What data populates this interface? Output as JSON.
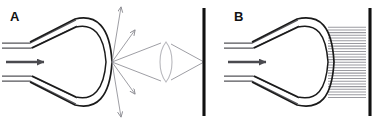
{
  "figure": {
    "width": 380,
    "height": 124,
    "background": "#ffffff",
    "type": "scientific-diagram"
  },
  "colors": {
    "outline": "#1a1a1a",
    "ray": "#8d8d93",
    "lens": "#b8b8bd",
    "hatch": "#9a9aa0",
    "bar": "#111111",
    "arrow": "#4a4a4f",
    "guide": "#55555a",
    "label": "#111111"
  },
  "panels": [
    {
      "id": "A",
      "label": "A",
      "label_x": 10,
      "label_y": 21,
      "components": {
        "waveguide_label": "input waveguide",
        "horn_label": "horn antenna",
        "propagation_arrow_label": "incident wave direction",
        "scattered_rays_label": "diverging radiated rays",
        "lens_label": "biconvex focusing lens",
        "screen_label": "screen",
        "focus_label": "focal point"
      },
      "ray_count": 8,
      "screen_x": 204,
      "lens_center_x": 166,
      "lens_center_y": 62
    },
    {
      "id": "B",
      "label": "B",
      "label_x": 234,
      "label_y": 21,
      "components": {
        "waveguide_label": "input waveguide",
        "horn_label": "horn antenna",
        "propagation_arrow_label": "incident wave direction",
        "dielectric_label": "hatched dielectric coupling block",
        "screen_label": "screen"
      },
      "hatch_line_count": 27,
      "screen_x": 370,
      "block_left_x": 328,
      "block_right_x": 366
    }
  ],
  "geometry": {
    "panelA": {
      "horn_outer": "M 30,42 L 75,19 C 96,14 110,26 112,62 C 110,98 96,110 75,105 L 30,82",
      "horn_inner": "M 32,48 L 76,27 C 93,23 104,34 106,62 C 104,90 93,101 76,97 L 32,76",
      "waveguide_top_a": "M 2,43 L 30,43 L 76,20",
      "waveguide_top_b": "M 2,48 L 31,48 L 77,26",
      "waveguide_bot_a": "M 2,76 L 31,76 L 77,98",
      "waveguide_bot_b": "M 2,81 L 30,81 L 76,104",
      "arrow_y": 62,
      "arrow_x1": 6,
      "arrow_x2": 46,
      "aperture_focus_x": 112,
      "aperture_focus_y": 62,
      "scatter_targets": [
        [
          122,
          6
        ],
        [
          136,
          30
        ],
        [
          149,
          48
        ],
        [
          200,
          44
        ],
        [
          200,
          80
        ],
        [
          149,
          76
        ],
        [
          136,
          95
        ],
        [
          122,
          118
        ]
      ],
      "lens_top_y": 42,
      "lens_bot_y": 82,
      "screen_top_y": 8,
      "screen_bot_y": 116
    },
    "panelB": {
      "horn_outer": "M 252,42 L 297,19 C 320,14 332,26 334,62 C 332,98 320,110 297,105 L 252,82",
      "horn_inner": "M 254,48 L 298,27 C 317,23 326,34 328,62 C 326,90 317,101 298,97 L 254,76",
      "waveguide_top_a": "M 224,43 L 252,43 L 298,20",
      "waveguide_top_b": "M 224,48 L 253,48 L 299,26",
      "waveguide_bot_a": "M 224,76 L 253,76 L 299,98",
      "waveguide_bot_b": "M 224,81 L 252,81 L 298,104",
      "arrow_y": 62,
      "arrow_x1": 228,
      "arrow_x2": 268,
      "block_top_y": 26,
      "block_bot_y": 98,
      "screen_top_y": 8,
      "screen_bot_y": 116
    }
  }
}
